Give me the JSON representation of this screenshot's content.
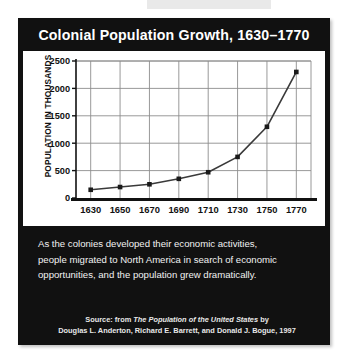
{
  "poster": {
    "title": "Colonial Population Growth, 1630–1770",
    "background_color": "#111111",
    "title_color": "#ffffff"
  },
  "caption": {
    "lines": [
      "As the colonies developed their economic activities,",
      "people migrated to North America in search of economic",
      "opportunities, and the population grew dramatically."
    ]
  },
  "source": {
    "line1_prefix": "Source:  from ",
    "line1_italic": "The Population of the United States",
    "line1_suffix": " by",
    "line2": "Douglas L. Anderton, Richard E. Barrett, and Donald J. Bogue, 1997"
  },
  "chart_data": {
    "type": "line",
    "title": "Colonial Population Growth, 1630–1770",
    "xlabel": "",
    "ylabel": "POPULATION IN THOUSANDS",
    "x": [
      1630,
      1650,
      1670,
      1690,
      1710,
      1730,
      1750,
      1770
    ],
    "categories": [
      "1630",
      "1650",
      "1670",
      "1690",
      "1710",
      "1730",
      "1750",
      "1770"
    ],
    "values": [
      150,
      200,
      250,
      350,
      470,
      750,
      1300,
      2300
    ],
    "xlim": [
      1620,
      1780
    ],
    "ylim": [
      0,
      2500
    ],
    "yticks": [
      0,
      500,
      1000,
      1500,
      2000,
      2500
    ],
    "ytick_labels": [
      "0",
      "500",
      "1000",
      "1500",
      "2000",
      "2500"
    ],
    "xticks": [
      1630,
      1650,
      1670,
      1690,
      1710,
      1730,
      1750,
      1770
    ],
    "xtick_labels": [
      "1630",
      "1650",
      "1670",
      "1690",
      "1710",
      "1730",
      "1750",
      "1770"
    ],
    "grid": true,
    "grid_color": "#8d8d8d",
    "line_color": "#3a3a3a",
    "marker": "square",
    "marker_color": "#1a1a1a",
    "legend": null,
    "plot_background": "#ffffff"
  }
}
